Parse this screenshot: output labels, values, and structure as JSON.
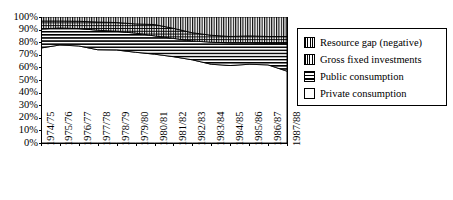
{
  "chart_data": {
    "type": "area",
    "title": "",
    "xlabel": "",
    "ylabel": "",
    "ylim": [
      0,
      100
    ],
    "grid": false,
    "stacked": true,
    "stack_order": "bottom-to-top",
    "legend_position": "right",
    "categories": [
      "1974/75",
      "1975/76",
      "1976/77",
      "1977/78",
      "1978/79",
      "1979/80",
      "1980/81",
      "1981/82",
      "1982/83",
      "1983/84",
      "1984/85",
      "1985/86",
      "1986/87",
      "1987/88"
    ],
    "y_tick_labels": [
      "100%",
      "90%",
      "80%",
      "70%",
      "60%",
      "50%",
      "40%",
      "30%",
      "20%",
      "10%",
      "0%"
    ],
    "y_tick_values": [
      100,
      90,
      80,
      70,
      60,
      50,
      40,
      30,
      20,
      10,
      0
    ],
    "series": [
      {
        "name": "Private consumption",
        "pattern": "empty",
        "values": [
          75.4,
          77.8,
          77.0,
          74.0,
          73.8,
          72.0,
          70.5,
          68.5,
          66.0,
          62.5,
          61.5,
          62.5,
          62.0,
          57.0
        ]
      },
      {
        "name": "Public consumption",
        "pattern": "horizontal-lines",
        "values": [
          15.1,
          13.5,
          13.8,
          15.5,
          14.8,
          15.2,
          14.5,
          14.5,
          15.0,
          17.5,
          18.0,
          17.0,
          17.0,
          22.0
        ]
      },
      {
        "name": "Gross fixed investments",
        "pattern": "dotted-grid",
        "values": [
          6.3,
          5.5,
          5.8,
          6.5,
          7.0,
          7.3,
          9.0,
          8.0,
          6.5,
          5.5,
          5.0,
          5.5,
          5.5,
          5.5
        ]
      },
      {
        "name": "Resource gap (negative)",
        "pattern": "vertical-lines",
        "values": [
          3.2,
          3.2,
          3.4,
          4.0,
          4.4,
          5.5,
          6.0,
          9.0,
          12.5,
          14.5,
          15.5,
          15.0,
          15.5,
          15.5
        ]
      }
    ]
  },
  "legend": {
    "entries": [
      {
        "label": "Resource gap (negative)",
        "pattern": "vertical-lines"
      },
      {
        "label": "Gross fixed investments",
        "pattern": "dotted-grid"
      },
      {
        "label": "Public consumption",
        "pattern": "horizontal-lines"
      },
      {
        "label": "Private consumption",
        "pattern": "empty"
      }
    ]
  },
  "plot": {
    "left": 41,
    "right": 287,
    "top": 17,
    "bottom": 143
  }
}
